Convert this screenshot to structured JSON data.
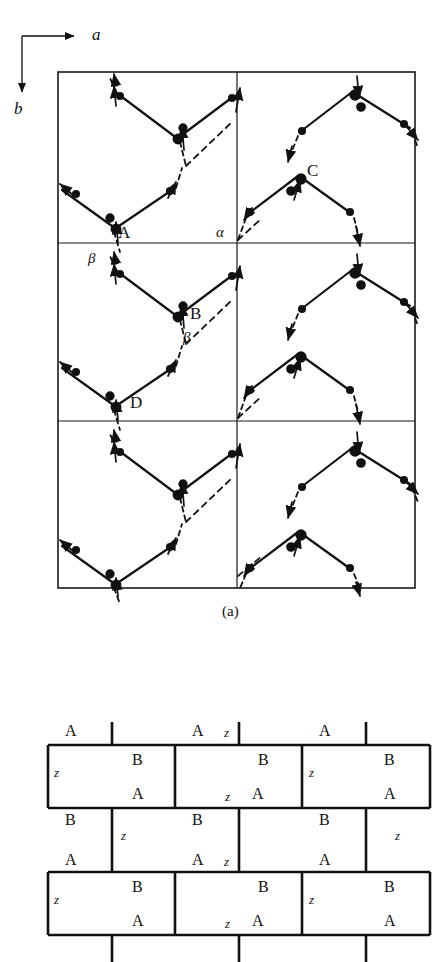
{
  "figure": {
    "panels": [
      {
        "id": "a",
        "caption": "(a)"
      },
      {
        "id": "b",
        "caption": ""
      }
    ]
  },
  "axes": {
    "horizontal_label": "a",
    "vertical_label": "b",
    "origin": {
      "x": 22,
      "y": 36
    },
    "h_arrow_end": {
      "x": 78,
      "y": 36
    },
    "v_arrow_end": {
      "x": 22,
      "y": 96
    }
  },
  "panel_a": {
    "frame": {
      "x": 58,
      "y": 72,
      "width": 357,
      "height": 516
    },
    "divider_x": [
      237
    ],
    "divider_y": [
      243,
      421
    ],
    "site_labels": [
      {
        "text": "A",
        "x": 118,
        "y": 224
      },
      {
        "text": "C",
        "x": 307,
        "y": 162
      },
      {
        "text": "B",
        "x": 190,
        "y": 305
      },
      {
        "text": "D",
        "x": 130,
        "y": 394
      }
    ],
    "greek_labels": [
      {
        "text": "α",
        "x": 216,
        "y": 225
      },
      {
        "text": "β",
        "x": 88,
        "y": 251
      },
      {
        "text": "β",
        "x": 183,
        "y": 330
      }
    ],
    "caption": "(a)",
    "caption_pos": {
      "x": 222,
      "y": 604
    },
    "notes": "zigzag spin chains, solid bonds within chain, dashed inter-chain links, arrowheads mark moment directions"
  },
  "panel_b": {
    "frame": {
      "x": 48,
      "y": 724,
      "width": 382,
      "height": 238
    },
    "row_lines_y": [
      745,
      808,
      872,
      935
    ],
    "col_pitch": 127,
    "cells": [
      {
        "row": 0,
        "labels": [
          {
            "text": "A",
            "x": 65,
            "y": 729,
            "style": "upright"
          },
          {
            "text": "A",
            "x": 192,
            "y": 729,
            "style": "upright"
          },
          {
            "text": "z",
            "x": 223,
            "y": 731,
            "style": "italic"
          },
          {
            "text": "A",
            "x": 319,
            "y": 729,
            "style": "upright"
          }
        ]
      },
      {
        "row": 1,
        "labels": [
          {
            "text": "z",
            "x": 77,
            "y": 770,
            "style": "italic"
          },
          {
            "text": "B",
            "x": 132,
            "y": 757,
            "style": "upright"
          },
          {
            "text": "B",
            "x": 258,
            "y": 757,
            "style": "upright"
          },
          {
            "text": "z",
            "x": 328,
            "y": 770,
            "style": "italic"
          },
          {
            "text": "B",
            "x": 384,
            "y": 757,
            "style": "upright"
          },
          {
            "text": "A",
            "x": 132,
            "y": 790,
            "style": "upright"
          },
          {
            "text": "z",
            "x": 226,
            "y": 792,
            "style": "italic"
          },
          {
            "text": "A",
            "x": 258,
            "y": 790,
            "style": "upright"
          },
          {
            "text": "A",
            "x": 384,
            "y": 790,
            "style": "upright"
          }
        ]
      },
      {
        "row": 2,
        "labels": [
          {
            "text": "B",
            "x": 65,
            "y": 815,
            "style": "upright"
          },
          {
            "text": "z",
            "x": 140,
            "y": 832,
            "style": "italic"
          },
          {
            "text": "B",
            "x": 192,
            "y": 815,
            "style": "upright"
          },
          {
            "text": "B",
            "x": 319,
            "y": 815,
            "style": "upright"
          },
          {
            "text": "z",
            "x": 395,
            "y": 832,
            "style": "italic"
          },
          {
            "text": "A",
            "x": 65,
            "y": 855,
            "style": "upright"
          },
          {
            "text": "A",
            "x": 192,
            "y": 855,
            "style": "upright"
          },
          {
            "text": "z",
            "x": 223,
            "y": 857,
            "style": "italic"
          },
          {
            "text": "A",
            "x": 319,
            "y": 855,
            "style": "upright"
          }
        ]
      },
      {
        "row": 3,
        "labels": [
          {
            "text": "z",
            "x": 77,
            "y": 897,
            "style": "italic"
          },
          {
            "text": "B",
            "x": 132,
            "y": 884,
            "style": "upright"
          },
          {
            "text": "B",
            "x": 258,
            "y": 884,
            "style": "upright"
          },
          {
            "text": "z",
            "x": 328,
            "y": 897,
            "style": "italic"
          },
          {
            "text": "B",
            "x": 384,
            "y": 884,
            "style": "upright"
          },
          {
            "text": "A",
            "x": 132,
            "y": 917,
            "style": "upright"
          },
          {
            "text": "z",
            "x": 226,
            "y": 919,
            "style": "italic"
          },
          {
            "text": "A",
            "x": 258,
            "y": 917,
            "style": "upright"
          },
          {
            "text": "A",
            "x": 384,
            "y": 917,
            "style": "upright"
          }
        ]
      }
    ]
  },
  "colors": {
    "ink": "#111111",
    "background": "#ffffff",
    "line": "#1a1a1a"
  }
}
